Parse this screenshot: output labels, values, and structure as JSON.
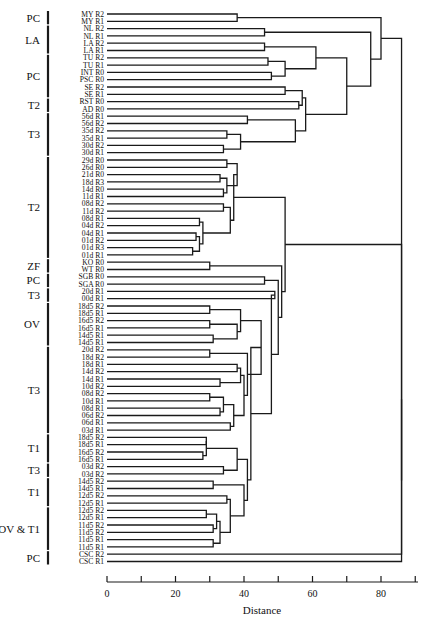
{
  "chart_data": {
    "type": "dendrogram",
    "title": "",
    "xlabel": "Distance",
    "ylabel": "",
    "xlim": [
      0,
      90
    ],
    "xticks": [
      0,
      10,
      20,
      30,
      40,
      50,
      60,
      70,
      80,
      90
    ],
    "xtick_labels": [
      "0",
      "",
      "20",
      "",
      "40",
      "",
      "60",
      "",
      "80",
      ""
    ],
    "grid": false,
    "legend": null,
    "leaves": [
      "MY R2",
      "MY R1",
      "NL R2",
      "NL R1",
      "LA R2",
      "LA R1",
      "TU R2",
      "TU R1",
      "INT R0",
      "PSC R0",
      "SE R2",
      "SE R1",
      "RST R0",
      "AD R0",
      "56d R1",
      "56d R2",
      "35d R2",
      "35d R1",
      "30d R2",
      "30d R1",
      "29d R0",
      "26d R0",
      "21d R0",
      "18d R3",
      "14d R0",
      "11d R1",
      "08d R2",
      "11d R2",
      "08d R1",
      "04d R2",
      "04d R1",
      "01d R2",
      "01d R3",
      "01d R1",
      "KO R0",
      "WT R0",
      "SGB R0",
      "SGA R0",
      "20d R1",
      "00d R1",
      "18d5 R2",
      "18d5 R1",
      "16d5 R2",
      "16d5 R1",
      "14d5 R1",
      "14d5 R1",
      "20d R2",
      "18d R2",
      "18d R1",
      "14d R2",
      "14d R1",
      "10d R2",
      "08d R2",
      "10d R1",
      "08d R1",
      "06d R2",
      "06d R1",
      "03d R1",
      "18d5 R2",
      "18d5 R1",
      "16d5 R2",
      "16d5 R1",
      "03d R2",
      "03d R2",
      "14d5 R2",
      "14d5 R1",
      "12d5 R2",
      "12d5 R1",
      "12d5 R2",
      "12d5 R1",
      "11d5 R2",
      "11d5 R2",
      "11d5 R1",
      "11d5 R1",
      "CSC R2",
      "CSC R1"
    ],
    "groups": [
      {
        "label": "PC",
        "from": 0,
        "to": 1
      },
      {
        "label": "LA",
        "from": 2,
        "to": 5
      },
      {
        "label": "PC",
        "from": 6,
        "to": 11
      },
      {
        "label": "T2",
        "from": 12,
        "to": 13
      },
      {
        "label": "T3",
        "from": 14,
        "to": 19
      },
      {
        "label": "T2",
        "from": 20,
        "to": 33
      },
      {
        "label": "ZF",
        "from": 34,
        "to": 35
      },
      {
        "label": "PC",
        "from": 36,
        "to": 37
      },
      {
        "label": "T3",
        "from": 38,
        "to": 39
      },
      {
        "label": "OV",
        "from": 40,
        "to": 45
      },
      {
        "label": "T3",
        "from": 46,
        "to": 57
      },
      {
        "label": "T1",
        "from": 58,
        "to": 61
      },
      {
        "label": "T3",
        "from": 62,
        "to": 63
      },
      {
        "label": "T1",
        "from": 64,
        "to": 67
      },
      {
        "label": "OV & T1",
        "from": 68,
        "to": 73
      },
      {
        "label": "PC",
        "from": 74,
        "to": 75
      }
    ],
    "merges": [
      {
        "id": "m1",
        "a": 0,
        "b": 1,
        "height": 38
      },
      {
        "id": "m2",
        "a": 2,
        "b": 3,
        "height": 46
      },
      {
        "id": "m3",
        "a": 4,
        "b": 5,
        "height": 46
      },
      {
        "id": "m4",
        "a": 6,
        "b": 7,
        "height": 47
      },
      {
        "id": "m5",
        "a": 8,
        "b": 9,
        "height": 48
      },
      {
        "id": "m6",
        "a": "m4",
        "b": "m5",
        "height": 52
      },
      {
        "id": "m7",
        "a": "m3",
        "b": "m6",
        "height": 61
      },
      {
        "id": "m8",
        "a": 10,
        "b": 11,
        "height": 52
      },
      {
        "id": "m9",
        "a": 12,
        "b": 13,
        "height": 56
      },
      {
        "id": "m10",
        "a": "m8",
        "b": "m9",
        "height": 57
      },
      {
        "id": "m11",
        "a": 14,
        "b": 15,
        "height": 41
      },
      {
        "id": "m12",
        "a": 16,
        "b": 17,
        "height": 35
      },
      {
        "id": "m13",
        "a": 18,
        "b": 19,
        "height": 34
      },
      {
        "id": "m14",
        "a": "m12",
        "b": "m13",
        "height": 39
      },
      {
        "id": "m15",
        "a": "m11",
        "b": "m14",
        "height": 55
      },
      {
        "id": "m16",
        "a": "m10",
        "b": "m15",
        "height": 58
      },
      {
        "id": "m17",
        "a": "m7",
        "b": "m16",
        "height": 70
      },
      {
        "id": "m18",
        "a": "m2",
        "b": "m17",
        "height": 77
      },
      {
        "id": "m19",
        "a": "m1",
        "b": "m18",
        "height": 80
      },
      {
        "id": "m20",
        "a": 20,
        "b": 21,
        "height": 35
      },
      {
        "id": "m21",
        "a": 22,
        "b": 23,
        "height": 33
      },
      {
        "id": "m22",
        "a": 24,
        "b": 25,
        "height": 34
      },
      {
        "id": "m23",
        "a": "m21",
        "b": "m22",
        "height": 35
      },
      {
        "id": "m24",
        "a": "m20",
        "b": "m23",
        "height": 38
      },
      {
        "id": "m25",
        "a": 26,
        "b": 27,
        "height": 34
      },
      {
        "id": "m26",
        "a": 28,
        "b": 29,
        "height": 27
      },
      {
        "id": "m27",
        "a": 30,
        "b": 31,
        "height": 26
      },
      {
        "id": "m28",
        "a": 32,
        "b": 33,
        "height": 25
      },
      {
        "id": "m29",
        "a": "m27",
        "b": "m28",
        "height": 27
      },
      {
        "id": "m30",
        "a": "m26",
        "b": "m29",
        "height": 28
      },
      {
        "id": "m31",
        "a": "m25",
        "b": "m30",
        "height": 36
      },
      {
        "id": "m32",
        "a": "m24",
        "b": "m31",
        "height": 37
      },
      {
        "id": "m33",
        "a": 34,
        "b": 35,
        "height": 30
      },
      {
        "id": "m34",
        "a": 36,
        "b": 37,
        "height": 46
      },
      {
        "id": "m35",
        "a": 38,
        "b": 39,
        "height": 49
      },
      {
        "id": "m36",
        "a": 40,
        "b": 41,
        "height": 30
      },
      {
        "id": "m37",
        "a": 42,
        "b": 43,
        "height": 30
      },
      {
        "id": "m38",
        "a": 44,
        "b": 45,
        "height": 31
      },
      {
        "id": "m39",
        "a": "m37",
        "b": "m38",
        "height": 38
      },
      {
        "id": "m40",
        "a": "m36",
        "b": "m39",
        "height": 39
      },
      {
        "id": "m41",
        "a": 46,
        "b": 47,
        "height": 30
      },
      {
        "id": "m42",
        "a": 48,
        "b": 49,
        "height": 38
      },
      {
        "id": "m43",
        "a": 50,
        "b": 51,
        "height": 33
      },
      {
        "id": "m44",
        "a": "m42",
        "b": "m43",
        "height": 39
      },
      {
        "id": "m45",
        "a": 52,
        "b": 53,
        "height": 30
      },
      {
        "id": "m46",
        "a": 54,
        "b": 55,
        "height": 33
      },
      {
        "id": "m47",
        "a": "m45",
        "b": "m46",
        "height": 34
      },
      {
        "id": "m48",
        "a": 56,
        "b": 57,
        "height": 36
      },
      {
        "id": "m49",
        "a": "m47",
        "b": "m48",
        "height": 37
      },
      {
        "id": "m50",
        "a": "m44",
        "b": "m49",
        "height": 40
      },
      {
        "id": "m51",
        "a": "m41",
        "b": "m50",
        "height": 41
      },
      {
        "id": "m52",
        "a": "m40",
        "b": "m51",
        "height": 45
      },
      {
        "id": "m53",
        "a": 58,
        "b": 59,
        "height": 29
      },
      {
        "id": "m54",
        "a": 60,
        "b": 61,
        "height": 28
      },
      {
        "id": "m55",
        "a": "m53",
        "b": "m54",
        "height": 29
      },
      {
        "id": "m56",
        "a": 62,
        "b": 63,
        "height": 34
      },
      {
        "id": "m57",
        "a": "m55",
        "b": "m56",
        "height": 38
      },
      {
        "id": "m58",
        "a": 64,
        "b": 65,
        "height": 31
      },
      {
        "id": "m59",
        "a": 66,
        "b": 67,
        "height": 35
      },
      {
        "id": "m60",
        "a": 68,
        "b": 69,
        "height": 29
      },
      {
        "id": "m61",
        "a": 70,
        "b": 71,
        "height": 31
      },
      {
        "id": "m62",
        "a": "m60",
        "b": "m61",
        "height": 32
      },
      {
        "id": "m63",
        "a": 72,
        "b": 73,
        "height": 31
      },
      {
        "id": "m64",
        "a": "m62",
        "b": "m63",
        "height": 33
      },
      {
        "id": "m65",
        "a": "m59",
        "b": "m64",
        "height": 36
      },
      {
        "id": "m66",
        "a": "m58",
        "b": "m65",
        "height": 40
      },
      {
        "id": "m67",
        "a": "m57",
        "b": "m66",
        "height": 41
      },
      {
        "id": "m68",
        "a": "m52",
        "b": "m67",
        "height": 42
      },
      {
        "id": "m69",
        "a": "m35",
        "b": "m68",
        "height": 48
      },
      {
        "id": "m70",
        "a": "m34",
        "b": "m69",
        "height": 50
      },
      {
        "id": "m71",
        "a": "m33",
        "b": "m70",
        "height": 51
      },
      {
        "id": "m72",
        "a": "m32",
        "b": "m71",
        "height": 52
      },
      {
        "id": "m73",
        "a": "m72",
        "b": 74,
        "height": 86
      },
      {
        "id": "m74",
        "a": "m73",
        "b": 75,
        "height": 86
      },
      {
        "id": "m75",
        "a": "m19",
        "b": "m74",
        "height": 86
      }
    ]
  }
}
